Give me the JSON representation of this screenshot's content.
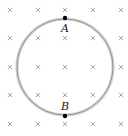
{
  "diagram": {
    "field": {
      "symbol": "×",
      "direction": "into-page",
      "color": "#a8a8a8",
      "grid_x": [
        10,
        38,
        65,
        93,
        121
      ],
      "grid_y": [
        10,
        38,
        67,
        95,
        124
      ]
    },
    "loop": {
      "cx": 65,
      "cy": 67,
      "r": 48,
      "outer_color": "#d4d4d4",
      "inner_color": "#8a8a8a"
    },
    "points": [
      {
        "label": "A",
        "x": 65,
        "y": 18,
        "label_x": 61,
        "label_y": 32
      },
      {
        "label": "B",
        "x": 65,
        "y": 116,
        "label_x": 61,
        "label_y": 110
      }
    ]
  }
}
